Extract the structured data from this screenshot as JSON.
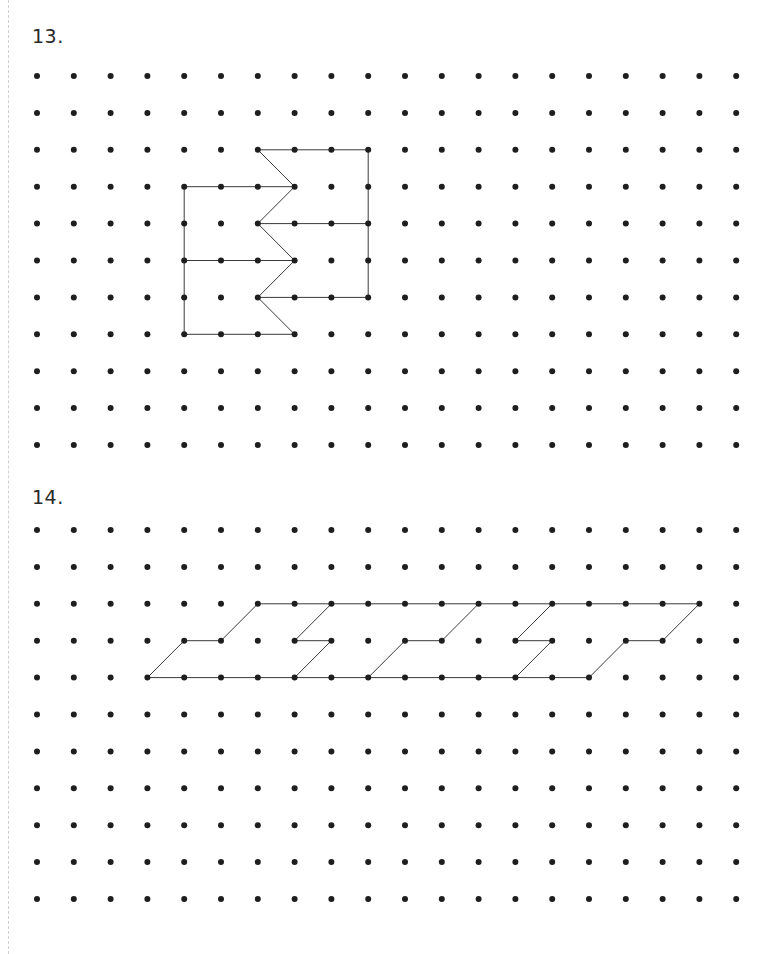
{
  "problems": [
    {
      "label": "13.",
      "grid": {
        "cols": 20,
        "rows": 11,
        "origin_x": 37,
        "origin_y": 76,
        "spacing_x": 36.8,
        "spacing_y": 36.9
      },
      "segments": [
        [
          [
            6,
            2
          ],
          [
            9,
            2
          ]
        ],
        [
          [
            6,
            2
          ],
          [
            7,
            3
          ]
        ],
        [
          [
            9,
            2
          ],
          [
            9,
            6
          ]
        ],
        [
          [
            4,
            3
          ],
          [
            7,
            3
          ]
        ],
        [
          [
            4,
            3
          ],
          [
            4,
            7
          ]
        ],
        [
          [
            7,
            3
          ],
          [
            6,
            4
          ]
        ],
        [
          [
            6,
            4
          ],
          [
            9,
            4
          ]
        ],
        [
          [
            6,
            4
          ],
          [
            7,
            5
          ]
        ],
        [
          [
            4,
            5
          ],
          [
            7,
            5
          ]
        ],
        [
          [
            7,
            5
          ],
          [
            6,
            6
          ]
        ],
        [
          [
            6,
            6
          ],
          [
            9,
            6
          ]
        ],
        [
          [
            6,
            6
          ],
          [
            7,
            7
          ]
        ],
        [
          [
            4,
            7
          ],
          [
            7,
            7
          ]
        ]
      ]
    },
    {
      "label": "14.",
      "grid": {
        "cols": 20,
        "rows": 11,
        "origin_x": 37,
        "origin_y": 530,
        "spacing_x": 36.8,
        "spacing_y": 36.9
      },
      "segments": [
        [
          [
            3,
            4
          ],
          [
            15,
            4
          ]
        ],
        [
          [
            6,
            2
          ],
          [
            18,
            2
          ]
        ],
        [
          [
            3,
            4
          ],
          [
            4,
            3
          ]
        ],
        [
          [
            4,
            3
          ],
          [
            5,
            3
          ]
        ],
        [
          [
            5,
            3
          ],
          [
            6,
            2
          ]
        ],
        [
          [
            8,
            2
          ],
          [
            7,
            3
          ]
        ],
        [
          [
            7,
            3
          ],
          [
            8,
            3
          ]
        ],
        [
          [
            8,
            3
          ],
          [
            7,
            4
          ]
        ],
        [
          [
            10,
            3
          ],
          [
            9,
            4
          ]
        ],
        [
          [
            10,
            3
          ],
          [
            11,
            3
          ]
        ],
        [
          [
            11,
            3
          ],
          [
            12,
            2
          ]
        ],
        [
          [
            14,
            2
          ],
          [
            13,
            3
          ]
        ],
        [
          [
            13,
            3
          ],
          [
            14,
            3
          ]
        ],
        [
          [
            14,
            3
          ],
          [
            13,
            4
          ]
        ],
        [
          [
            15,
            4
          ],
          [
            16,
            3
          ]
        ],
        [
          [
            16,
            3
          ],
          [
            17,
            3
          ]
        ],
        [
          [
            17,
            3
          ],
          [
            18,
            2
          ]
        ]
      ]
    }
  ],
  "style": {
    "dot_color": "#1e1e1e",
    "dot_radius": 3,
    "line_color": "#3a3a3a",
    "line_width": 1,
    "text_color": "#2a2a2a"
  }
}
